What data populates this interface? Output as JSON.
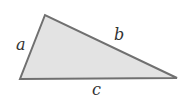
{
  "diagram": {
    "title": "",
    "shape": "triangle",
    "fill_color": "#e3e3e3",
    "stroke_color": "#707070",
    "vertices": [
      [
        45,
        15
      ],
      [
        20,
        79
      ],
      [
        177,
        78
      ]
    ],
    "labels": {
      "a": "a",
      "b": "b",
      "c": "c"
    }
  }
}
